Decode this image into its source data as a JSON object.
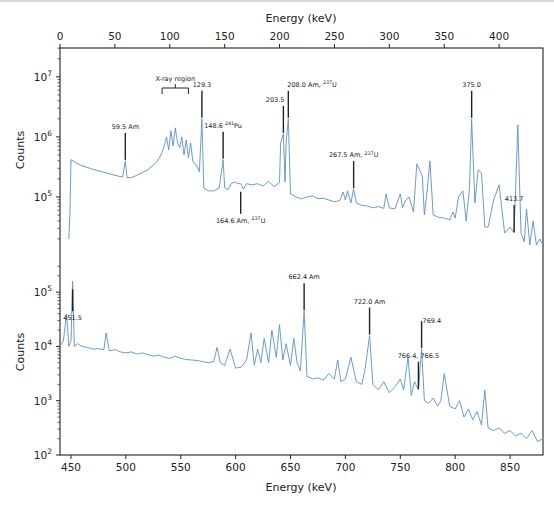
{
  "chart_data": [
    {
      "type": "line",
      "panel": "top",
      "title": "",
      "xlabel": "Energy (keV)",
      "xlabel_position": "top",
      "ylabel": "Counts",
      "yscale": "log",
      "xlim": [
        0,
        440
      ],
      "ylim_log10": [
        4.2,
        7.48
      ],
      "x_ticks": [
        0,
        50,
        100,
        150,
        200,
        250,
        300,
        350,
        400
      ],
      "y_ticks": [
        "10^5",
        "10^6",
        "10^7"
      ],
      "y_tick_values_log10": [
        5,
        6,
        7
      ],
      "line_color": "#5b8ec9",
      "grid": false,
      "series": [
        {
          "name": "spectrum 0-440 keV",
          "x": [
            8,
            9,
            10,
            12,
            15,
            20,
            30,
            40,
            50,
            57,
            59.5,
            61,
            65,
            70,
            80,
            88,
            92,
            95,
            97,
            99,
            101,
            103,
            105,
            107,
            109,
            111,
            113,
            115,
            117,
            119,
            121,
            123,
            125,
            127,
            129.3,
            131,
            135,
            140,
            145,
            146,
            148.6,
            150,
            153,
            156,
            159,
            162,
            164.6,
            167,
            170,
            175,
            180,
            185,
            190,
            195,
            200,
            201,
            203.5,
            205,
            206,
            208,
            210,
            215,
            220,
            225,
            230,
            235,
            240,
            245,
            250,
            255,
            258,
            260,
            262,
            265,
            267.5,
            270,
            275,
            280,
            285,
            290,
            295,
            297,
            300,
            305,
            310,
            312,
            315,
            318,
            322,
            325,
            330,
            332,
            335,
            337,
            340,
            345,
            350,
            355,
            358,
            360,
            363,
            367,
            370,
            373,
            375,
            378,
            381,
            384,
            387,
            390,
            395,
            400,
            405,
            410,
            413.7,
            417,
            420,
            423,
            425,
            428,
            431,
            434,
            437,
            440
          ],
          "log10_counts": [
            4.3,
            4.7,
            5.62,
            5.6,
            5.56,
            5.52,
            5.46,
            5.41,
            5.36,
            5.33,
            5.6,
            5.32,
            5.32,
            5.36,
            5.45,
            5.58,
            5.7,
            5.85,
            6.0,
            5.78,
            6.1,
            5.85,
            6.15,
            5.9,
            5.82,
            6.0,
            5.7,
            5.95,
            5.65,
            5.9,
            5.6,
            5.55,
            5.5,
            5.42,
            6.3,
            5.15,
            5.1,
            5.1,
            5.15,
            5.28,
            5.62,
            5.15,
            5.12,
            5.22,
            5.25,
            5.22,
            5.22,
            5.13,
            5.22,
            5.2,
            5.22,
            5.18,
            5.26,
            5.17,
            5.24,
            5.9,
            6.05,
            5.25,
            5.9,
            6.3,
            5.05,
            5.0,
            4.97,
            5.0,
            5.02,
            4.97,
            4.98,
            4.95,
            4.92,
            4.94,
            5.08,
            4.95,
            5.1,
            4.9,
            5.13,
            4.9,
            4.86,
            4.85,
            4.82,
            4.84,
            4.81,
            5.05,
            4.82,
            4.8,
            5.05,
            4.82,
            4.95,
            5.0,
            4.75,
            5.55,
            5.35,
            4.7,
            5.2,
            5.6,
            4.7,
            4.66,
            4.65,
            4.62,
            4.75,
            4.65,
            5.0,
            5.1,
            4.6,
            5.15,
            6.3,
            4.9,
            5.45,
            5.4,
            4.5,
            4.5,
            4.95,
            5.2,
            4.4,
            4.5,
            4.4,
            6.2,
            4.4,
            4.25,
            4.8,
            4.2,
            4.6,
            4.2,
            4.3,
            4.2,
            4.25
          ]
        }
      ],
      "annotations": [
        {
          "label": "59.5 Am",
          "x": 59.5
        },
        {
          "label": "X-ray region",
          "x_range": [
            93,
            117
          ]
        },
        {
          "label": "129.3",
          "x": 129.3
        },
        {
          "label": "148.6 241Pu",
          "x": 148.6
        },
        {
          "label": "164.6 Am, 237U",
          "x": 164.6,
          "position": "below"
        },
        {
          "label": "203.5",
          "x": 203.5
        },
        {
          "label": "208.0 Am, 237U",
          "x": 208.0
        },
        {
          "label": "267.5 Am, 237U",
          "x": 267.5
        },
        {
          "label": "375.0",
          "x": 375.0
        },
        {
          "label": "413.7",
          "x": 413.7
        }
      ]
    },
    {
      "type": "line",
      "panel": "bottom",
      "title": "",
      "xlabel": "Energy (keV)",
      "xlabel_position": "bottom",
      "ylabel": "Counts",
      "yscale": "log",
      "xlim": [
        440,
        880
      ],
      "ylim_log10": [
        2,
        5.5
      ],
      "x_ticks": [
        450,
        500,
        550,
        600,
        650,
        700,
        750,
        800,
        850
      ],
      "y_ticks": [
        "10^2",
        "10^3",
        "10^4",
        "10^5"
      ],
      "y_tick_values_log10": [
        2,
        3,
        4,
        5
      ],
      "line_color": "#5b8ec9",
      "grid": false,
      "series": [
        {
          "name": "spectrum 440-880 keV",
          "x": [
            440,
            443,
            446,
            448,
            450,
            451.5,
            453,
            456,
            460,
            465,
            470,
            475,
            480,
            482,
            485,
            490,
            495,
            500,
            505,
            510,
            515,
            520,
            525,
            530,
            535,
            540,
            545,
            550,
            555,
            560,
            565,
            570,
            575,
            580,
            583,
            586,
            590,
            595,
            600,
            605,
            610,
            614,
            617,
            620,
            623,
            626,
            630,
            633,
            637,
            640,
            643,
            646,
            650,
            653,
            656,
            659,
            662.4,
            665,
            670,
            675,
            680,
            685,
            690,
            693,
            696,
            700,
            705,
            710,
            715,
            718,
            722.0,
            725,
            730,
            735,
            740,
            745,
            750,
            753,
            757,
            760,
            763,
            766.5,
            769.4,
            772,
            776,
            780,
            784,
            787,
            790,
            795,
            800,
            804,
            808,
            812,
            816,
            820,
            824,
            827,
            830,
            835,
            840,
            845,
            850,
            855,
            860,
            865,
            870,
            875,
            880
          ],
          "log10_counts": [
            4.0,
            4.1,
            4.6,
            4.0,
            4.1,
            5.2,
            4.0,
            4.05,
            4.0,
            3.98,
            3.95,
            3.96,
            3.94,
            4.25,
            3.92,
            3.94,
            3.9,
            3.88,
            3.9,
            3.86,
            3.88,
            3.85,
            3.82,
            3.84,
            3.8,
            3.78,
            3.82,
            3.78,
            3.76,
            3.75,
            3.74,
            3.72,
            3.7,
            3.72,
            3.98,
            3.7,
            3.65,
            3.95,
            3.6,
            3.62,
            3.75,
            4.25,
            3.65,
            3.95,
            3.7,
            4.15,
            3.7,
            4.3,
            3.8,
            4.4,
            3.75,
            4.05,
            3.65,
            4.15,
            3.7,
            3.55,
            4.65,
            3.45,
            3.4,
            3.42,
            3.38,
            3.5,
            3.4,
            3.75,
            3.35,
            3.4,
            3.8,
            3.35,
            3.3,
            3.6,
            4.2,
            3.3,
            3.2,
            3.35,
            3.15,
            3.25,
            3.4,
            3.2,
            3.8,
            3.1,
            3.35,
            3.2,
            3.95,
            3.0,
            2.95,
            3.05,
            2.9,
            3.0,
            3.5,
            2.9,
            2.85,
            3.0,
            2.7,
            2.85,
            2.65,
            2.8,
            2.55,
            3.2,
            2.5,
            2.45,
            2.5,
            2.4,
            2.45,
            2.35,
            2.4,
            2.3,
            2.45,
            2.25,
            2.3,
            2.2,
            2.3
          ]
        }
      ],
      "annotations": [
        {
          "label": "451.5",
          "x": 451.5,
          "position": "below"
        },
        {
          "label": "662.4 Am",
          "x": 662.4
        },
        {
          "label": "722.0 Am",
          "x": 722.0
        },
        {
          "label": "766.4, 766.5",
          "x": 766.5
        },
        {
          "label": "769.4",
          "x": 769.4
        }
      ]
    }
  ],
  "figure": {
    "top_axis_title": "Energy (keV)",
    "bottom_axis_title": "Energy (keV)",
    "top_ylabel": "Counts",
    "bottom_ylabel": "Counts"
  }
}
